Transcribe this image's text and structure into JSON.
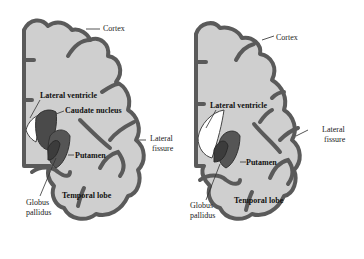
{
  "colors": {
    "background": "#ffffff",
    "brain_fill": "#cfcfcf",
    "cortex_outline": "#5a5a5a",
    "nuclei_fill": "#4a4a4a",
    "ventricle_fill": "#ffffff"
  },
  "panels": [
    {
      "id": "left",
      "labels": {
        "cortex": "Cortex",
        "lateral_ventricle": "Lateral ventricle",
        "caudate_nucleus": "Caudate nucleus",
        "lateral_fissure_1": "Lateral",
        "lateral_fissure_2": "fissure",
        "putamen": "Putamen",
        "globus_pallidus_1": "Globus",
        "globus_pallidus_2": "pallidus",
        "temporal_lobe": "Temporal lobe"
      }
    },
    {
      "id": "right",
      "labels": {
        "cortex": "Cortex",
        "lateral_ventricle": "Lateral ventricle",
        "lateral_fissure_1": "Lateral",
        "lateral_fissure_2": "fissure",
        "putamen": "Putamen",
        "globus_pallidus_1": "Globus",
        "globus_pallidus_2": "pallidus",
        "temporal_lobe": "Temporal lobe"
      }
    }
  ]
}
